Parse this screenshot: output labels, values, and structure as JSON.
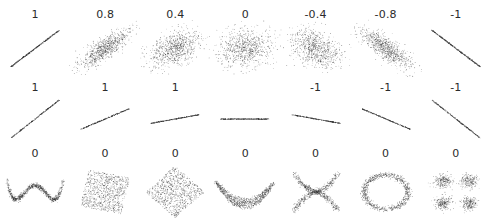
{
  "figure": {
    "background_color": "#ffffff",
    "point_color": "#2e2e2e",
    "label_color": "#2b2b2b"
  },
  "chart_data": {
    "type": "scatter",
    "title": "",
    "xlabel": "",
    "ylabel": "",
    "grid": false,
    "legend": null,
    "axes_visible": false,
    "tick_labels": [],
    "layout": {
      "rows": 3,
      "columns": 7,
      "panel_label_position": "above-panel"
    },
    "annotations": [
      "1",
      "0.8",
      "0.4",
      "0",
      "-0.4",
      "-0.8",
      "-1",
      "1",
      "1",
      "1",
      "",
      "-1",
      "-1",
      "-1",
      "0",
      "0",
      "0",
      "0",
      "0",
      "0",
      "0"
    ],
    "rows": [
      {
        "row_name": "varying-correlation-bivariate-normal",
        "panels": [
          {
            "label": "1",
            "value": 1.0,
            "shape": "line-positive",
            "slope": 1.0,
            "spread": 0.0,
            "n": 420
          },
          {
            "label": "0.8",
            "value": 0.8,
            "shape": "cloud",
            "slope": 1.0,
            "spread": 0.8,
            "n": 820
          },
          {
            "label": "0.4",
            "value": 0.4,
            "shape": "cloud",
            "slope": 1.0,
            "spread": 0.4,
            "n": 820
          },
          {
            "label": "0",
            "value": 0.0,
            "shape": "cloud",
            "slope": 0.0,
            "spread": 0.0,
            "n": 820
          },
          {
            "label": "-0.4",
            "value": -0.4,
            "shape": "cloud",
            "slope": -1.0,
            "spread": 0.4,
            "n": 820
          },
          {
            "label": "-0.8",
            "value": -0.8,
            "shape": "cloud",
            "slope": -1.0,
            "spread": 0.8,
            "n": 820
          },
          {
            "label": "-1",
            "value": -1.0,
            "shape": "line-negative",
            "slope": -1.0,
            "spread": 0.0,
            "n": 420
          }
        ]
      },
      {
        "row_name": "slope-invariance-perfect-correlation",
        "panels": [
          {
            "label": "1",
            "value": 1.0,
            "shape": "line",
            "slope": 1.15,
            "n": 330
          },
          {
            "label": "1",
            "value": 1.0,
            "shape": "line",
            "slope": 0.62,
            "n": 330
          },
          {
            "label": "1",
            "value": 1.0,
            "shape": "line",
            "slope": 0.26,
            "n": 330
          },
          {
            "label": "",
            "value": null,
            "shape": "line",
            "slope": 0.0,
            "n": 330,
            "note": "undefined"
          },
          {
            "label": "-1",
            "value": -1.0,
            "shape": "line",
            "slope": -0.26,
            "n": 330
          },
          {
            "label": "-1",
            "value": -1.0,
            "shape": "line",
            "slope": -0.62,
            "n": 330
          },
          {
            "label": "-1",
            "value": -1.0,
            "shape": "line",
            "slope": -1.15,
            "n": 330
          }
        ]
      },
      {
        "row_name": "nonlinear-dependence-zero-correlation",
        "panels": [
          {
            "label": "0",
            "value": 0.0,
            "shape": "w-curve",
            "n": 900
          },
          {
            "label": "0",
            "value": 0.0,
            "shape": "rotated-square",
            "rotation_deg": -12,
            "n": 900
          },
          {
            "label": "0",
            "value": 0.0,
            "shape": "diamond",
            "rotation_deg": 45,
            "n": 900
          },
          {
            "label": "0",
            "value": 0.0,
            "shape": "crescent",
            "n": 900
          },
          {
            "label": "0",
            "value": 0.0,
            "shape": "x-cross",
            "n": 900
          },
          {
            "label": "0",
            "value": 0.0,
            "shape": "ring",
            "n": 900
          },
          {
            "label": "0",
            "value": 0.0,
            "shape": "four-clusters",
            "n": 900
          }
        ]
      }
    ]
  }
}
